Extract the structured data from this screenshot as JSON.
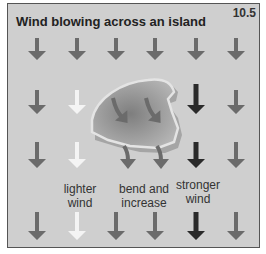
{
  "figure": {
    "title": "Wind blowing across an island",
    "number": "10.5"
  },
  "labels": {
    "lighter": "lighter wind",
    "bend": "bend and increase",
    "stronger": "stronger wind"
  },
  "colors": {
    "background": "#cfcfcf",
    "arrow_normal": "#6b6b6b",
    "arrow_light": "#f4f4f4",
    "arrow_strong": "#2a2a2a",
    "island_fill": "#9a9a9a",
    "island_edge": "#dcdcdc"
  },
  "arrow_grid": {
    "rows": [
      [
        "normal",
        "normal",
        "normal",
        "normal",
        "normal",
        "normal"
      ],
      [
        "normal",
        "light",
        "island",
        "island",
        "strong",
        "normal"
      ],
      [
        "normal",
        "light",
        "bend",
        "bend",
        "strong",
        "normal"
      ],
      [
        "normal",
        "light",
        "normal",
        "normal",
        "strong",
        "normal"
      ]
    ]
  }
}
